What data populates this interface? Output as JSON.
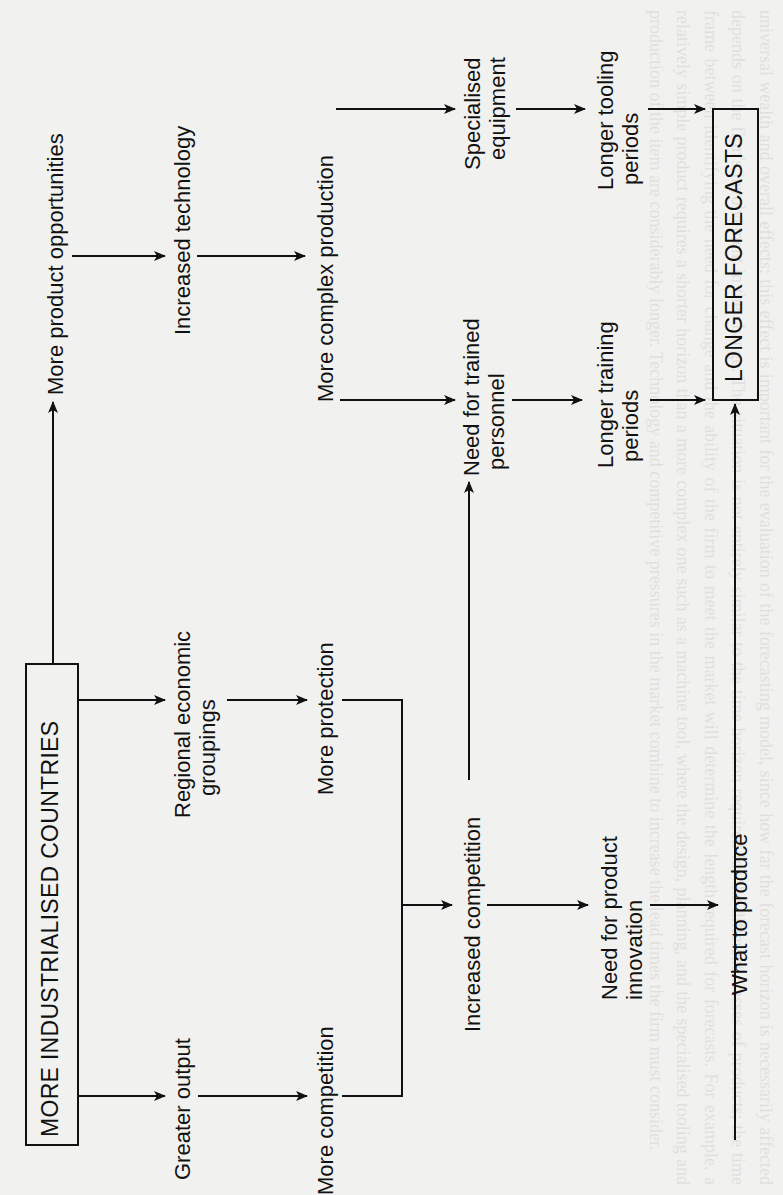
{
  "diagram": {
    "source_node": "MORE INDUSTRIALISED COUNTRIES",
    "target_node": "LONGER FORECASTS",
    "nodes": {
      "more_product_opportunities": "More product opportunities",
      "increased_technology": "Increased technology",
      "more_complex_production": "More complex production",
      "specialised_equipment_l1": "Specialised",
      "specialised_equipment_l2": "equipment",
      "longer_tooling_l1": "Longer tooling",
      "longer_tooling_l2": "periods",
      "need_trained_l1": "Need for trained",
      "need_trained_l2": "personnel",
      "longer_training_l1": "Longer training",
      "longer_training_l2": "periods",
      "regional_groupings_l1": "Regional economic",
      "regional_groupings_l2": "groupings",
      "more_protection": "More protection",
      "greater_output": "Greater output",
      "more_competition": "More competition",
      "increased_competition": "Increased competition",
      "need_innovation_l1": "Need for product",
      "need_innovation_l2": "innovation",
      "what_to_produce": "What to produce"
    },
    "edges": [
      [
        "MORE INDUSTRIALISED COUNTRIES",
        "More product opportunities"
      ],
      [
        "More product opportunities",
        "Increased technology"
      ],
      [
        "Increased technology",
        "More complex production"
      ],
      [
        "More complex production",
        "Specialised equipment"
      ],
      [
        "Specialised equipment",
        "Longer tooling periods"
      ],
      [
        "Longer tooling periods",
        "LONGER FORECASTS"
      ],
      [
        "More complex production",
        "Need for trained personnel"
      ],
      [
        "Need for trained personnel",
        "Longer training periods"
      ],
      [
        "Longer training periods",
        "LONGER FORECASTS"
      ],
      [
        "MORE INDUSTRIALISED COUNTRIES",
        "Regional economic groupings"
      ],
      [
        "Regional economic groupings",
        "More protection"
      ],
      [
        "MORE INDUSTRIALISED COUNTRIES",
        "Greater output"
      ],
      [
        "Greater output",
        "More competition"
      ],
      [
        "More protection",
        "Increased competition"
      ],
      [
        "More competition",
        "Increased competition"
      ],
      [
        "Increased competition",
        "Need for trained personnel"
      ],
      [
        "Increased competition",
        "Need for product innovation"
      ],
      [
        "Need for product innovation",
        "What to produce"
      ],
      [
        "What to produce",
        "LONGER FORECASTS"
      ]
    ]
  },
  "background_text": "universal wealth and overall effects; this effect is important for the evaluation of the forecasting model, since how far the forecast horizon is necessarily affected depends on the firm's involvement in the change. The situation is not entirely similar to the time horizon required for the different classes of products; the time frame between identifying the need for change and the ability of the firm to meet the market will determine the length required for forecasts. For example, a relatively simple product requires a shorter horizon than a more complex one such as a machine tool, where the design, planning, and the specialised tooling and production of the item are considerably longer. Technology and competitive pressures in the market combine to increase the lead times the firm must consider."
}
